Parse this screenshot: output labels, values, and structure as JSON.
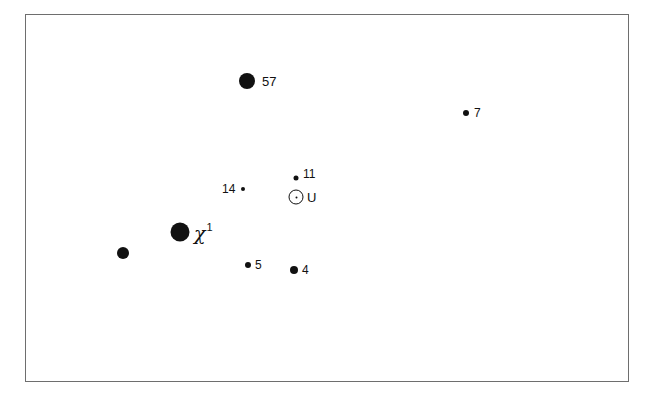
{
  "diagram": {
    "frame": {
      "x": 25,
      "y": 14,
      "width": 604,
      "height": 368,
      "border_color": "#6e6e6e"
    },
    "points": [
      {
        "id": "57",
        "label": "57",
        "x": 247,
        "y": 81,
        "size": 16,
        "label_dx": 15,
        "label_style": "big"
      },
      {
        "id": "7",
        "label": "7",
        "x": 466,
        "y": 113,
        "size": 6,
        "label_dx": 8,
        "label_style": "normal"
      },
      {
        "id": "11",
        "label": "11",
        "x": 296,
        "y": 178,
        "size": 5,
        "label_dx": 7,
        "label_dy": -4,
        "label_style": "normal"
      },
      {
        "id": "14",
        "label": "14",
        "x": 243,
        "y": 189,
        "size": 4,
        "label_dx": -21,
        "label_style": "normal"
      },
      {
        "id": "chi1",
        "label": "χ",
        "label_sup": "1",
        "x": 180,
        "y": 232,
        "size": 19,
        "label_dx": 14,
        "label_style": "chi"
      },
      {
        "id": "unlabeled",
        "label": "",
        "x": 123,
        "y": 253,
        "size": 12
      },
      {
        "id": "5",
        "label": "5",
        "x": 248,
        "y": 265,
        "size": 6,
        "label_dx": 7,
        "label_style": "normal"
      },
      {
        "id": "4",
        "label": "4",
        "x": 294,
        "y": 270,
        "size": 8,
        "label_dx": 8,
        "label_style": "normal"
      }
    ],
    "sun": {
      "symbol": "sun-symbol",
      "label": "U",
      "x": 296,
      "y": 197,
      "label_dx": 11
    }
  }
}
